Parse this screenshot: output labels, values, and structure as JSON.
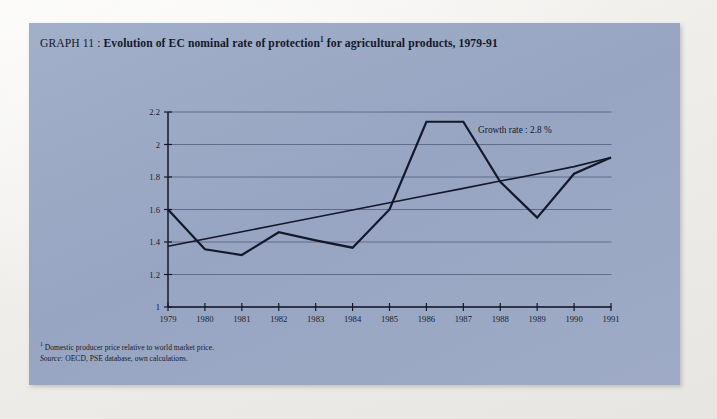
{
  "panel": {
    "background_color": "#9aa8c4"
  },
  "title": {
    "prefix": "GRAPH 11",
    "separator": " : ",
    "main": "Evolution of EC nominal rate of protection",
    "footnote_marker": "1",
    "tail": " for agricultural products, 1979-91"
  },
  "footnotes": {
    "marker": "1",
    "note": "Domestic producer price relative to world market price.",
    "source_label": "Source:",
    "source_text": "OECD, PSE database, own calculations."
  },
  "chart_data": {
    "type": "line",
    "xlabel": "",
    "ylabel": "",
    "x": [
      1979,
      1980,
      1981,
      1982,
      1983,
      1984,
      1985,
      1986,
      1987,
      1988,
      1989,
      1990,
      1991
    ],
    "categories": [
      "1979",
      "1980",
      "1981",
      "1982",
      "1983",
      "1984",
      "1985",
      "1986",
      "1987",
      "1988",
      "1989",
      "1990",
      "1991"
    ],
    "xlim": [
      1979,
      1991
    ],
    "ylim": [
      1,
      2.2
    ],
    "ytick_values": [
      1,
      1.2,
      1.4,
      1.6,
      1.8,
      2,
      2.2
    ],
    "ytick_labels": [
      "1",
      "1.2",
      "1.4",
      "1.6",
      "1.8",
      "2",
      "2.2"
    ],
    "grid": true,
    "grid_axis": "y",
    "legend": false,
    "line_color": "#14182a",
    "series": [
      {
        "name": "Nominal rate of protection",
        "kind": "data",
        "values": [
          1.6,
          1.355,
          1.32,
          1.46,
          1.41,
          1.365,
          1.6,
          2.14,
          2.14,
          1.77,
          1.55,
          1.82,
          1.92
        ]
      },
      {
        "name": "Trend",
        "kind": "trend",
        "values": [
          1.374,
          1.419,
          1.463,
          1.508,
          1.552,
          1.597,
          1.641,
          1.686,
          1.73,
          1.775,
          1.819,
          1.864,
          1.92
        ]
      }
    ],
    "annotations": [
      {
        "name": "growth-rate",
        "text": "Growth rate : 2.8 %",
        "x": 1987.4,
        "y": 2.07
      }
    ]
  }
}
